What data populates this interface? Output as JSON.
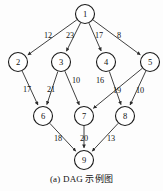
{
  "figure": {
    "caption": "(a) DAG 示例图",
    "colors": {
      "node_stroke": "#1a1a1a",
      "node_fill": "#ffffff",
      "edge_stroke": "#2b2b2b",
      "text": "#111111",
      "background": "#fdfdfd"
    }
  },
  "chart_data": {
    "type": "diagram",
    "title": "(a) DAG 示例图",
    "layout": "layered-top-down",
    "directed": true,
    "nodes": [
      {
        "id": "1",
        "label": "1",
        "x": 85,
        "y": 14,
        "r": 9.5,
        "layer": 0
      },
      {
        "id": "2",
        "label": "2",
        "x": 18,
        "y": 62,
        "r": 9.5,
        "layer": 1
      },
      {
        "id": "3",
        "label": "3",
        "x": 61,
        "y": 62,
        "r": 9.5,
        "layer": 1
      },
      {
        "id": "4",
        "label": "4",
        "x": 106,
        "y": 62,
        "r": 9.5,
        "layer": 1
      },
      {
        "id": "5",
        "label": "5",
        "x": 150,
        "y": 62,
        "r": 9.5,
        "layer": 1
      },
      {
        "id": "6",
        "label": "6",
        "x": 43,
        "y": 116,
        "r": 9.5,
        "layer": 2
      },
      {
        "id": "7",
        "label": "7",
        "x": 84,
        "y": 116,
        "r": 9.5,
        "layer": 2
      },
      {
        "id": "8",
        "label": "8",
        "x": 125,
        "y": 116,
        "r": 9.5,
        "layer": 2
      },
      {
        "id": "9",
        "label": "9",
        "x": 84,
        "y": 160,
        "r": 9.5,
        "layer": 3
      }
    ],
    "edges": [
      {
        "from": "1",
        "to": "2",
        "weight": 12,
        "label_x": 48,
        "label_y": 35
      },
      {
        "from": "1",
        "to": "3",
        "weight": 23,
        "label_x": 70,
        "label_y": 35
      },
      {
        "from": "1",
        "to": "4",
        "weight": 17,
        "label_x": 99,
        "label_y": 35
      },
      {
        "from": "1",
        "to": "5",
        "weight": 8,
        "label_x": 119,
        "label_y": 35
      },
      {
        "from": "2",
        "to": "6",
        "weight": 17,
        "label_x": 27,
        "label_y": 89
      },
      {
        "from": "3",
        "to": "6",
        "weight": 21,
        "label_x": 51,
        "label_y": 89
      },
      {
        "from": "3",
        "to": "7",
        "weight": 10,
        "label_x": 76,
        "label_y": 80
      },
      {
        "from": "4",
        "to": "8",
        "weight": 16,
        "label_x": 100,
        "label_y": 80
      },
      {
        "from": "5",
        "to": "7",
        "weight": 19,
        "label_x": 117,
        "label_y": 90
      },
      {
        "from": "5",
        "to": "8",
        "weight": 10,
        "label_x": 140,
        "label_y": 90
      },
      {
        "from": "6",
        "to": "9",
        "weight": 18,
        "label_x": 58,
        "label_y": 138
      },
      {
        "from": "7",
        "to": "9",
        "weight": 20,
        "label_x": 84,
        "label_y": 138
      },
      {
        "from": "8",
        "to": "9",
        "weight": 13,
        "label_x": 111,
        "label_y": 138
      }
    ],
    "node_count": 9,
    "edge_count": 13
  }
}
